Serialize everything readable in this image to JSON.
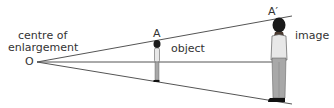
{
  "labels": {
    "centre_line1": "centre of",
    "centre_line2": "enlargement",
    "origin": "O",
    "point_a": "A",
    "point_a_prime": "A′",
    "object": "object",
    "image": "image"
  },
  "colors": {
    "line": "#555555",
    "text": "#333333",
    "hair": "#1a1a1a",
    "skin": "#4a3a30",
    "shirt": "#e8e8e8",
    "trousers": "#a8a8a8",
    "shoes": "#111111"
  }
}
